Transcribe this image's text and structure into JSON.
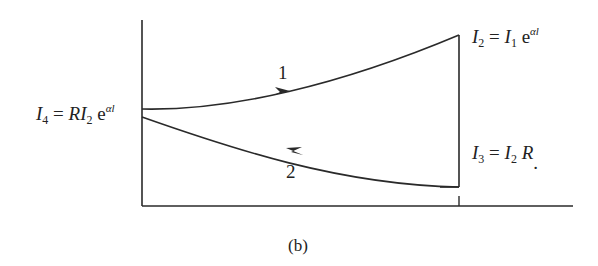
{
  "figure": {
    "caption": "(b)",
    "colors": {
      "stroke": "#2a2a2a",
      "text": "#222222",
      "background": "#ffffff"
    }
  },
  "labels": {
    "i4": {
      "lhs_symbol": "I",
      "lhs_sub": "4",
      "eq": " = ",
      "rhs_coef": "R",
      "rhs_symbol": "I",
      "rhs_sub": "2",
      "rhs_base": " e",
      "rhs_exp": "αl"
    },
    "i2": {
      "lhs_symbol": "I",
      "lhs_sub": "2",
      "eq": " = ",
      "rhs_symbol": "I",
      "rhs_sub": "1",
      "rhs_base": " e",
      "rhs_exp": "αl"
    },
    "i3": {
      "lhs_symbol": "I",
      "lhs_sub": "3",
      "eq": " = ",
      "rhs_symbol": "I",
      "rhs_sub": "2",
      "rhs_coef": " R",
      "trailing": "."
    }
  },
  "paths": [
    {
      "id": "1",
      "label": "1",
      "direction": "forward (left to right)",
      "from": "I4",
      "to": "I2"
    },
    {
      "id": "2",
      "label": "2",
      "direction": "backward (right to left)",
      "from": "I3",
      "to": "I4"
    }
  ],
  "axes": {
    "x_tick_label": "l",
    "x_axis": "position",
    "y_axis": "intensity"
  }
}
